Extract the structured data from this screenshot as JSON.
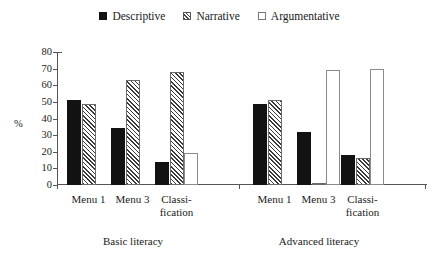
{
  "chart_data": {
    "type": "bar",
    "title": "",
    "xlabel": "",
    "ylabel": "%",
    "ylim": [
      0,
      80
    ],
    "yticks": [
      0,
      10,
      20,
      30,
      40,
      50,
      60,
      70,
      80
    ],
    "grid": false,
    "legend_position": "top-center",
    "categories": [
      "Menu 1",
      "Menu 3",
      "Classi-\nfication"
    ],
    "panels": [
      {
        "name": "Basic literacy",
        "categories": [
          "Menu 1",
          "Menu 3",
          "Classi-\nfication"
        ],
        "series": [
          {
            "name": "Descriptive",
            "values": [
              51,
              34,
              14
            ]
          },
          {
            "name": "Narrative",
            "values": [
              49,
              63,
              68
            ]
          },
          {
            "name": "Argumentative",
            "values": [
              0,
              0,
              19
            ]
          }
        ]
      },
      {
        "name": "Advanced literacy",
        "categories": [
          "Menu 1",
          "Menu 3",
          "Classi-\nfication"
        ],
        "series": [
          {
            "name": "Descriptive",
            "values": [
              49,
              32,
              18
            ]
          },
          {
            "name": "Narrative",
            "values": [
              51,
              1,
              16
            ]
          },
          {
            "name": "Argumentative",
            "values": [
              0,
              69,
              70
            ]
          }
        ]
      }
    ],
    "series_styles": [
      {
        "name": "Descriptive",
        "fill": "#121212",
        "pattern": "solid"
      },
      {
        "name": "Narrative",
        "fill": "#ffffff",
        "pattern": "hatch"
      },
      {
        "name": "Argumentative",
        "fill": "#ffffff",
        "pattern": "empty"
      }
    ]
  },
  "legend": {
    "items": [
      {
        "label": "Descriptive",
        "swatch": "filled-square-icon"
      },
      {
        "label": "Narrative",
        "swatch": "hatched-square-icon"
      },
      {
        "label": "Argumentative",
        "swatch": "empty-square-icon"
      }
    ]
  },
  "axis": {
    "y_label": "%",
    "y_ticks": [
      "80",
      "70",
      "60",
      "50",
      "40",
      "30",
      "20",
      "10",
      "0"
    ]
  },
  "panel_labels": [
    "Basic literacy",
    "Advanced literacy"
  ]
}
